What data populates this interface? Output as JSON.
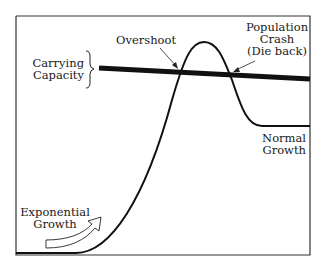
{
  "diagram": {
    "type": "population growth curve",
    "labels": {
      "carrying_capacity_line1": "Carrying",
      "carrying_capacity_line2": "Capacity",
      "overshoot": "Overshoot",
      "crash_line1": "Population",
      "crash_line2": "Crash",
      "crash_line3": "(Die back)",
      "normal_line1": "Normal",
      "normal_line2": "Growth",
      "exponential_line1": "Exponential",
      "exponential_line2": "Growth"
    },
    "colors": {
      "line": "#111111",
      "background": "#ffffff",
      "frame": "#333333"
    }
  }
}
